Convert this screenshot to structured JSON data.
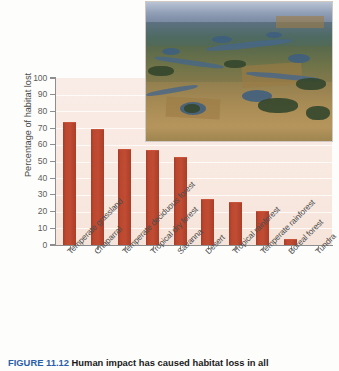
{
  "figure": {
    "caption_label": "FIGURE 11.12",
    "caption_text": "Human impact has caused habitat loss in all"
  },
  "photo": {
    "alt_name": "aerial-wetland-prairie-photograph"
  },
  "chart_data": {
    "type": "bar",
    "title": "",
    "xlabel": "",
    "ylabel": "Percentage of habitat lost",
    "ylim": [
      0,
      100
    ],
    "ytick_step": 10,
    "grid": true,
    "legend": "none",
    "bar_color": "#bd4830",
    "plot_background": "#f8e9e1",
    "categories": [
      "Temperate grassland",
      "Chaparral",
      "Temperate deciduous forest",
      "Tropical dry forest",
      "Savanna",
      "Desert",
      "Tropical rainforest",
      "Temperate rainforest",
      "Boreal forest",
      "Tundra"
    ],
    "values": [
      73,
      69,
      57,
      56,
      52,
      27,
      25,
      20,
      3,
      0
    ],
    "ytick_labels": [
      "0",
      "10",
      "20",
      "30",
      "40",
      "50",
      "60",
      "70",
      "80",
      "90",
      "100"
    ]
  }
}
